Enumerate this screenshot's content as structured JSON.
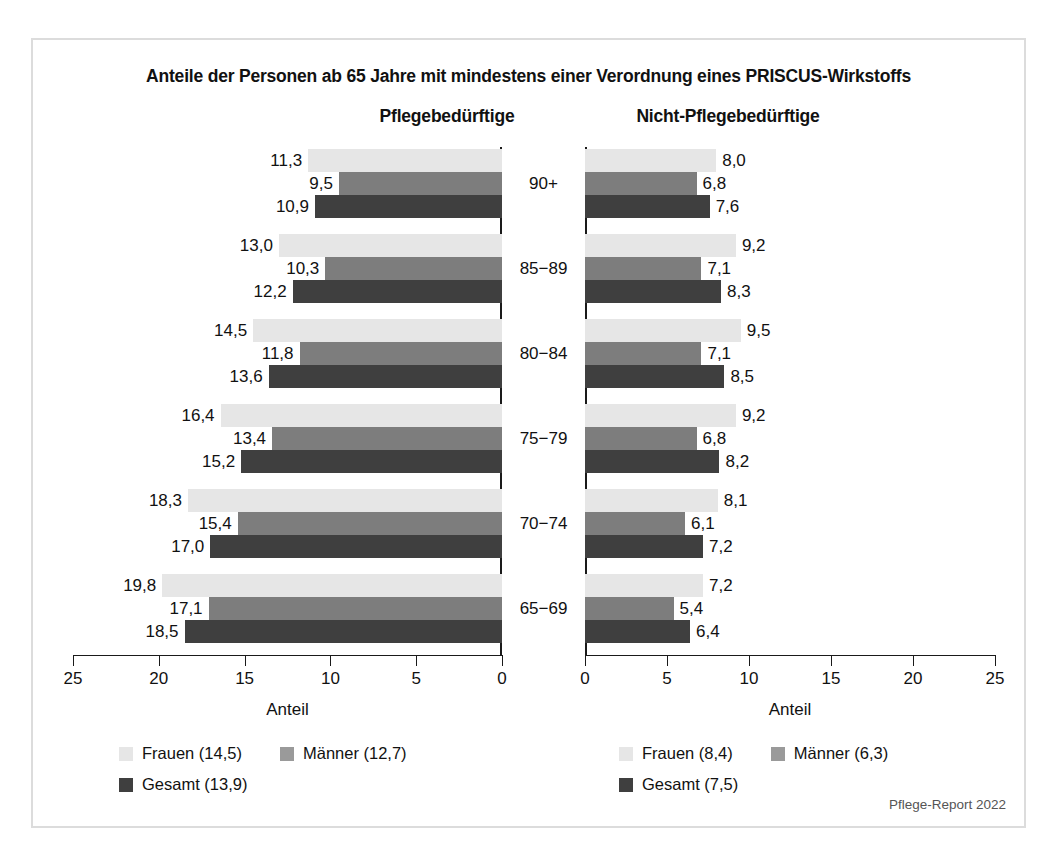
{
  "figure": {
    "title": "Anteile der Personen ab 65 Jahre mit mindestens einer Verordnung eines PRISCUS-Wirkstoffs",
    "source_note": "Pflege-Report 2022"
  },
  "panels": {
    "left_heading": "Pflegebedürftige",
    "right_heading": "Nicht-Pflegebedürftige",
    "axis_title": "Anteil"
  },
  "legend": {
    "left": [
      {
        "label": "Frauen (14,5)",
        "swatch": "frauen"
      },
      {
        "label": "Männer (12,7)",
        "swatch": "maenner"
      },
      {
        "label": "Gesamt (13,9)",
        "swatch": "gesamt"
      }
    ],
    "right": [
      {
        "label": "Frauen (8,4)",
        "swatch": "frauen"
      },
      {
        "label": "Männer (6,3)",
        "swatch": "maenner"
      },
      {
        "label": "Gesamt (7,5)",
        "swatch": "gesamt"
      }
    ]
  },
  "colors": {
    "frauen": "#e6e6e6",
    "maenner": "#7d7d7d",
    "gesamt": "#3f3f3f",
    "frame": "#dcdcdc",
    "axis": "#1a1a1a"
  },
  "age_labels": [
    "90+",
    "85−89",
    "80−84",
    "75−79",
    "70−74",
    "65−69"
  ],
  "ticks_left": [
    "25",
    "20",
    "15",
    "10",
    "5",
    "0"
  ],
  "ticks_right": [
    "0",
    "5",
    "10",
    "15",
    "20",
    "25"
  ],
  "value_labels": {
    "left": {
      "frauen": [
        "11,3",
        "13,0",
        "14,5",
        "16,4",
        "18,3",
        "19,8"
      ],
      "maenner": [
        "9,5",
        "10,3",
        "11,8",
        "13,4",
        "15,4",
        "17,1"
      ],
      "gesamt": [
        "10,9",
        "12,2",
        "13,6",
        "15,2",
        "17,0",
        "18,5"
      ]
    },
    "right": {
      "frauen": [
        "8,0",
        "9,2",
        "9,5",
        "9,2",
        "8,1",
        "7,2"
      ],
      "maenner": [
        "6,8",
        "7,1",
        "7,1",
        "6,8",
        "6,1",
        "5,4"
      ],
      "gesamt": [
        "7,6",
        "8,3",
        "8,5",
        "8,2",
        "7,2",
        "6,4"
      ]
    }
  },
  "chart_data": {
    "type": "bar",
    "title": "Anteile der Personen ab 65 Jahre mit mindestens einer Verordnung eines PRISCUS-Wirkstoffs",
    "orientation": "horizontal",
    "layout": "two-panel mirrored population pyramid style, shared centered category axis",
    "grid": false,
    "legend_position": "bottom",
    "xlabel": "Anteil",
    "ylabel": "",
    "categories": [
      "90+",
      "85−89",
      "80−84",
      "75−79",
      "70−74",
      "65−69"
    ],
    "panels": [
      {
        "name": "Pflegebedürftige",
        "position": "left",
        "axis_direction": "reversed",
        "xlim": [
          25,
          0
        ],
        "xticks": [
          25,
          20,
          15,
          10,
          5,
          0
        ],
        "series": [
          {
            "name": "Frauen",
            "color": "#e6e6e6",
            "overall": 14.5,
            "values": [
              11.3,
              13.0,
              14.5,
              16.4,
              18.3,
              19.8
            ]
          },
          {
            "name": "Männer",
            "color": "#7d7d7d",
            "overall": 12.7,
            "values": [
              9.5,
              10.3,
              11.8,
              13.4,
              15.4,
              17.1
            ]
          },
          {
            "name": "Gesamt",
            "color": "#3f3f3f",
            "overall": 13.9,
            "values": [
              10.9,
              12.2,
              13.6,
              15.2,
              17.0,
              18.5
            ]
          }
        ]
      },
      {
        "name": "Nicht-Pflegebedürftige",
        "position": "right",
        "axis_direction": "normal",
        "xlim": [
          0,
          25
        ],
        "xticks": [
          0,
          5,
          10,
          15,
          20,
          25
        ],
        "series": [
          {
            "name": "Frauen",
            "color": "#e6e6e6",
            "overall": 8.4,
            "values": [
              8.0,
              9.2,
              9.5,
              9.2,
              8.1,
              7.2
            ]
          },
          {
            "name": "Männer",
            "color": "#7d7d7d",
            "overall": 6.3,
            "values": [
              6.8,
              7.1,
              7.1,
              6.8,
              6.1,
              5.4
            ]
          },
          {
            "name": "Gesamt",
            "color": "#3f3f3f",
            "overall": 7.5,
            "values": [
              7.6,
              8.3,
              8.5,
              8.2,
              7.2,
              6.4
            ]
          }
        ]
      }
    ],
    "annotation": "Pflege-Report 2022"
  }
}
